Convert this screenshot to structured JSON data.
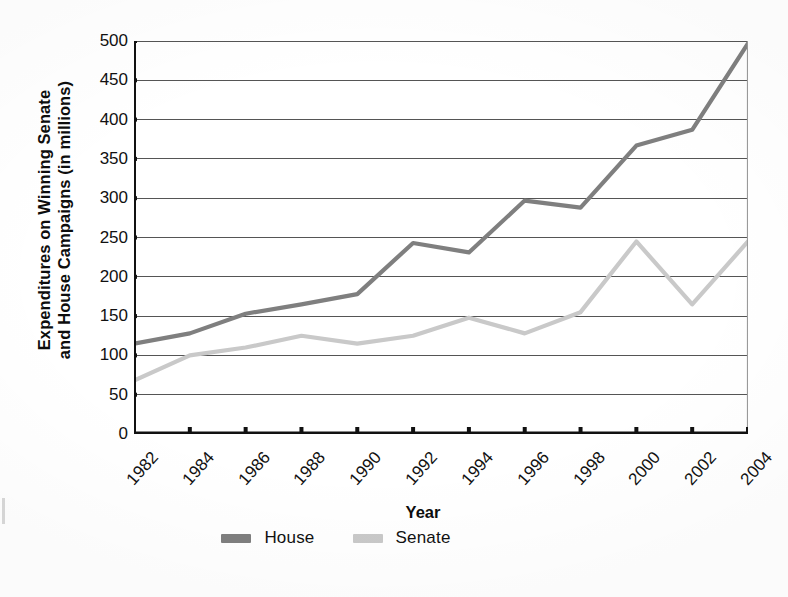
{
  "chart_data": {
    "type": "line",
    "title": "",
    "xlabel": "Year",
    "ylabel": "Expenditures on Winning Senate and House Campaigns (in millions)",
    "ylabel_line1": "Expenditures on Winning Senate",
    "ylabel_line2": "and House Campaigns (in millions)",
    "categories": [
      "1982",
      "1984",
      "1986",
      "1988",
      "1990",
      "1992",
      "1994",
      "1996",
      "1998",
      "2000",
      "2002",
      "2004"
    ],
    "x": [
      1982,
      1984,
      1986,
      1988,
      1990,
      1992,
      1994,
      1996,
      1998,
      2000,
      2002,
      2004
    ],
    "series": [
      {
        "name": "House",
        "color": "#7f7f7f",
        "values": [
          115,
          128,
          153,
          165,
          178,
          243,
          231,
          297,
          288,
          367,
          387,
          497
        ]
      },
      {
        "name": "Senate",
        "color": "#c9c9c9",
        "values": [
          68,
          100,
          110,
          125,
          115,
          125,
          148,
          128,
          155,
          245,
          165,
          245
        ]
      }
    ],
    "ylim": [
      0,
      500
    ],
    "yticks": [
      0,
      50,
      100,
      150,
      200,
      250,
      300,
      350,
      400,
      450,
      500
    ],
    "ytick_labels": [
      "0",
      "50",
      "100",
      "150",
      "200",
      "250",
      "300",
      "350",
      "400",
      "450",
      "500"
    ],
    "grid": "horizontal",
    "grid_color": "#555555",
    "axis_color": "#111111",
    "legend_position": "bottom-center"
  },
  "legend": {
    "items": [
      {
        "label": "House",
        "color": "#7f7f7f"
      },
      {
        "label": "Senate",
        "color": "#c9c9c9"
      }
    ]
  },
  "axes": {
    "x_title": "Year"
  }
}
